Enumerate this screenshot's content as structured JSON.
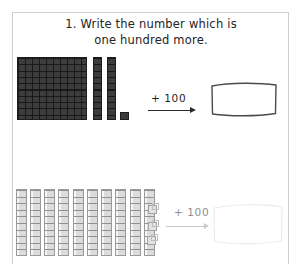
{
  "worksheet": {
    "prompt_number": "1.",
    "prompt_line1": "1.  Write the number which is",
    "prompt_line2": "one hundred more.",
    "frame_color": "#cfcfcf",
    "paper_color": "#ffffff"
  },
  "problems": [
    {
      "id": "problem-1",
      "blocks": {
        "hundreds_flats": 1,
        "tens_rods": 2,
        "ones_cubes": 1,
        "represented_value": "121",
        "block_color": "#3c3c3c",
        "block_line_color": "#1e1e1e"
      },
      "operation_label": "+ 100",
      "arrow": "right-arrow",
      "answer_value": "",
      "answer_box_style": "solid"
    },
    {
      "id": "problem-2",
      "blocks": {
        "hundreds_flats": 0,
        "tens_rods": 10,
        "ones_cubes": 3,
        "represented_value": "103",
        "block_color": "#dcdcdc",
        "block_line_color": "#9a9a9a"
      },
      "operation_label": "+ 100",
      "arrow": "right-arrow",
      "answer_value": "",
      "answer_box_style": "faint"
    }
  ]
}
